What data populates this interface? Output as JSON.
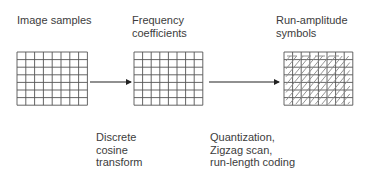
{
  "stages": [
    {
      "title_lines": [
        "Image samples"
      ],
      "grid": {
        "cols": 8,
        "rows": 7
      }
    },
    {
      "title_lines": [
        "Frequency",
        "coefficients"
      ],
      "grid": {
        "cols": 8,
        "rows": 7
      }
    },
    {
      "title_lines": [
        "Run-amplitude",
        "symbols"
      ],
      "grid": {
        "cols": 8,
        "rows": 7,
        "zigzag": true
      }
    }
  ],
  "transforms": [
    {
      "lines": [
        "Discrete",
        "cosine",
        "transform"
      ]
    },
    {
      "lines": [
        "Quantization,",
        "Zigzag scan,",
        "run-length coding"
      ]
    }
  ],
  "colors": {
    "grid": "#555555",
    "arrow": "#222222",
    "zigzag": "#888888",
    "text": "#3c3c3c"
  }
}
